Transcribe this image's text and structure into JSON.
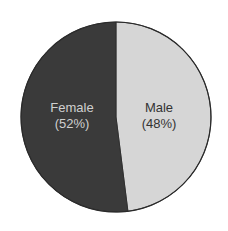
{
  "chart_data": {
    "type": "pie",
    "title": "",
    "categories": [
      "Male",
      "Female"
    ],
    "values": [
      48,
      52
    ],
    "unit": "%",
    "labels": [
      {
        "name": "Male",
        "pct": "(48%)"
      },
      {
        "name": "Female",
        "pct": "(52%)"
      }
    ],
    "colors": {
      "Male": "#d6d6d6",
      "Female": "#3a3a3a"
    },
    "label_colors": {
      "Male": "#333333",
      "Female": "#d0d0d0"
    },
    "start_angle_deg": 0,
    "direction": "clockwise",
    "legend": "none (inline labels)"
  }
}
